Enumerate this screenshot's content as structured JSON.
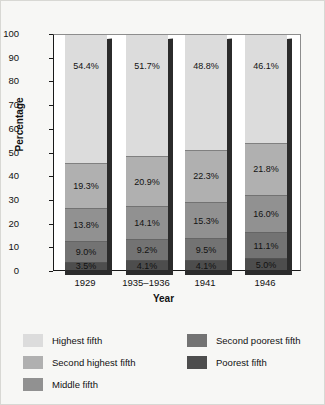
{
  "chart_data": {
    "type": "bar",
    "subtype": "stacked-bar-100",
    "title": "",
    "xlabel": "Year",
    "ylabel": "Percentage",
    "ylim": [
      0,
      100
    ],
    "yticks": [
      0,
      10,
      20,
      30,
      40,
      50,
      60,
      70,
      80,
      90,
      100
    ],
    "ytick_labels": [
      "0",
      "10",
      "20",
      "30",
      "40",
      "50",
      "60",
      "70",
      "80",
      "90",
      "100"
    ],
    "grid": false,
    "legend_position": "bottom",
    "categories": [
      "1929",
      "1935–1936",
      "1941",
      "1946"
    ],
    "series": [
      {
        "name": "Poorest fifth",
        "color": "#4d4d4d",
        "values": [
          3.5,
          4.1,
          4.1,
          5.0
        ],
        "labels": [
          "3.5%",
          "4.1%",
          "4.1%",
          "5.0%"
        ]
      },
      {
        "name": "Second poorest fifth",
        "color": "#737373",
        "values": [
          9.0,
          9.2,
          9.5,
          11.1
        ],
        "labels": [
          "9.0%",
          "9.2%",
          "9.5%",
          "11.1%"
        ]
      },
      {
        "name": "Middle fifth",
        "color": "#919191",
        "values": [
          13.8,
          14.1,
          15.3,
          16.0
        ],
        "labels": [
          "13.8%",
          "14.1%",
          "15.3%",
          "16.0%"
        ]
      },
      {
        "name": "Second highest fifth",
        "color": "#b0b0b0",
        "values": [
          19.3,
          20.9,
          22.3,
          21.8
        ],
        "labels": [
          "19.3%",
          "20.9%",
          "22.3%",
          "21.8%"
        ]
      },
      {
        "name": "Highest fifth",
        "color": "#dcdcdc",
        "values": [
          54.4,
          51.7,
          48.8,
          46.1
        ],
        "labels": [
          "54.4%",
          "51.7%",
          "48.8%",
          "46.1%"
        ]
      }
    ]
  },
  "legend": {
    "left_column": [
      {
        "label": "Highest fifth",
        "color": "#dcdcdc"
      },
      {
        "label": "Second highest fifth",
        "color": "#b0b0b0"
      },
      {
        "label": "Middle fifth",
        "color": "#919191"
      }
    ],
    "right_column": [
      {
        "label": "Second poorest fifth",
        "color": "#737373"
      },
      {
        "label": "Poorest fifth",
        "color": "#4d4d4d"
      }
    ]
  }
}
